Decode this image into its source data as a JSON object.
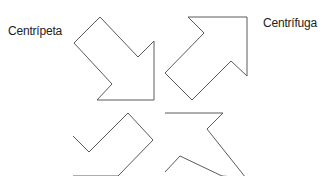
{
  "diagram": {
    "labels": {
      "centripeta": "Centrípeta",
      "centrifuga": "Centrífuga"
    },
    "stroke_color": "#5a5a5a",
    "background": "#ffffff",
    "arrows": [
      {
        "name": "arrow-down-right",
        "direction": "down-right",
        "points": "100,17 138,57 154,41 154,100 97,100 112,84 74,43"
      },
      {
        "name": "arrow-up-right",
        "direction": "up-right",
        "points": "188,17 247,17 247,76 231,61 192,100 165,73 204,33"
      },
      {
        "name": "arrow-down-left",
        "direction": "down-left",
        "points": "73,136 89,152 128,113 153,140 118,176 73,176"
      },
      {
        "name": "arrow-up-left",
        "direction": "up-left",
        "points": "165,113 223,113 207,129 246,178 222,176 180,156 165,172"
      }
    ]
  }
}
